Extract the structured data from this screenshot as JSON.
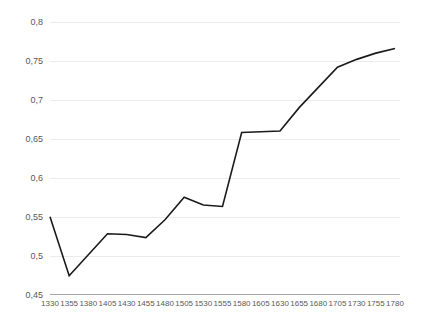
{
  "chart_data": {
    "type": "line",
    "title": "",
    "subtitle": "",
    "xlabel": "",
    "ylabel": "",
    "categories": [
      "1330",
      "1355",
      "1380",
      "1405",
      "1430",
      "1455",
      "1480",
      "1505",
      "1530",
      "1555",
      "1580",
      "1605",
      "1630",
      "1655",
      "1680",
      "1705",
      "1730",
      "1755",
      "1780"
    ],
    "x": [
      1330,
      1355,
      1380,
      1405,
      1430,
      1455,
      1480,
      1505,
      1530,
      1555,
      1580,
      1605,
      1630,
      1655,
      1680,
      1705,
      1730,
      1755,
      1780
    ],
    "values": [
      0.55,
      0.474,
      0.501,
      0.528,
      0.527,
      0.523,
      0.546,
      0.575,
      0.565,
      0.563,
      0.658,
      0.659,
      0.66,
      0.69,
      0.716,
      0.742,
      0.752,
      0.76,
      0.766
    ],
    "series": [
      {
        "name": "",
        "color": "#1b1b1b",
        "values": [
          0.55,
          0.474,
          0.501,
          0.528,
          0.527,
          0.523,
          0.546,
          0.575,
          0.565,
          0.563,
          0.658,
          0.659,
          0.66,
          0.69,
          0.716,
          0.742,
          0.752,
          0.76,
          0.766
        ]
      }
    ],
    "ylim": [
      0.45,
      0.8
    ],
    "xlim": [
      1330,
      1780
    ],
    "ytick_values": [
      0.45,
      0.5,
      0.55,
      0.6,
      0.65,
      0.7,
      0.75,
      0.8
    ],
    "ytick_labels": [
      "0,45",
      "0,5",
      "0,55",
      "0,6",
      "0,65",
      "0,7",
      "0,75",
      "0,8"
    ],
    "xtick_labels": [
      "1330",
      "1355",
      "1380",
      "1405",
      "1430",
      "1455",
      "1480",
      "1505",
      "1530",
      "1555",
      "1580",
      "1605",
      "1630",
      "1655",
      "1680",
      "1705",
      "1730",
      "1755",
      "1780"
    ],
    "grid": {
      "horizontal": true,
      "vertical": false,
      "color": "#eceaea"
    },
    "legend": {
      "visible": false,
      "position": "none",
      "entries": []
    },
    "axis": {
      "x_axis_line_color": "#a6a6a6",
      "y_axis_line_visible": false,
      "decimal_separator": ","
    },
    "annotations": [],
    "background_color": "#ffffff"
  }
}
